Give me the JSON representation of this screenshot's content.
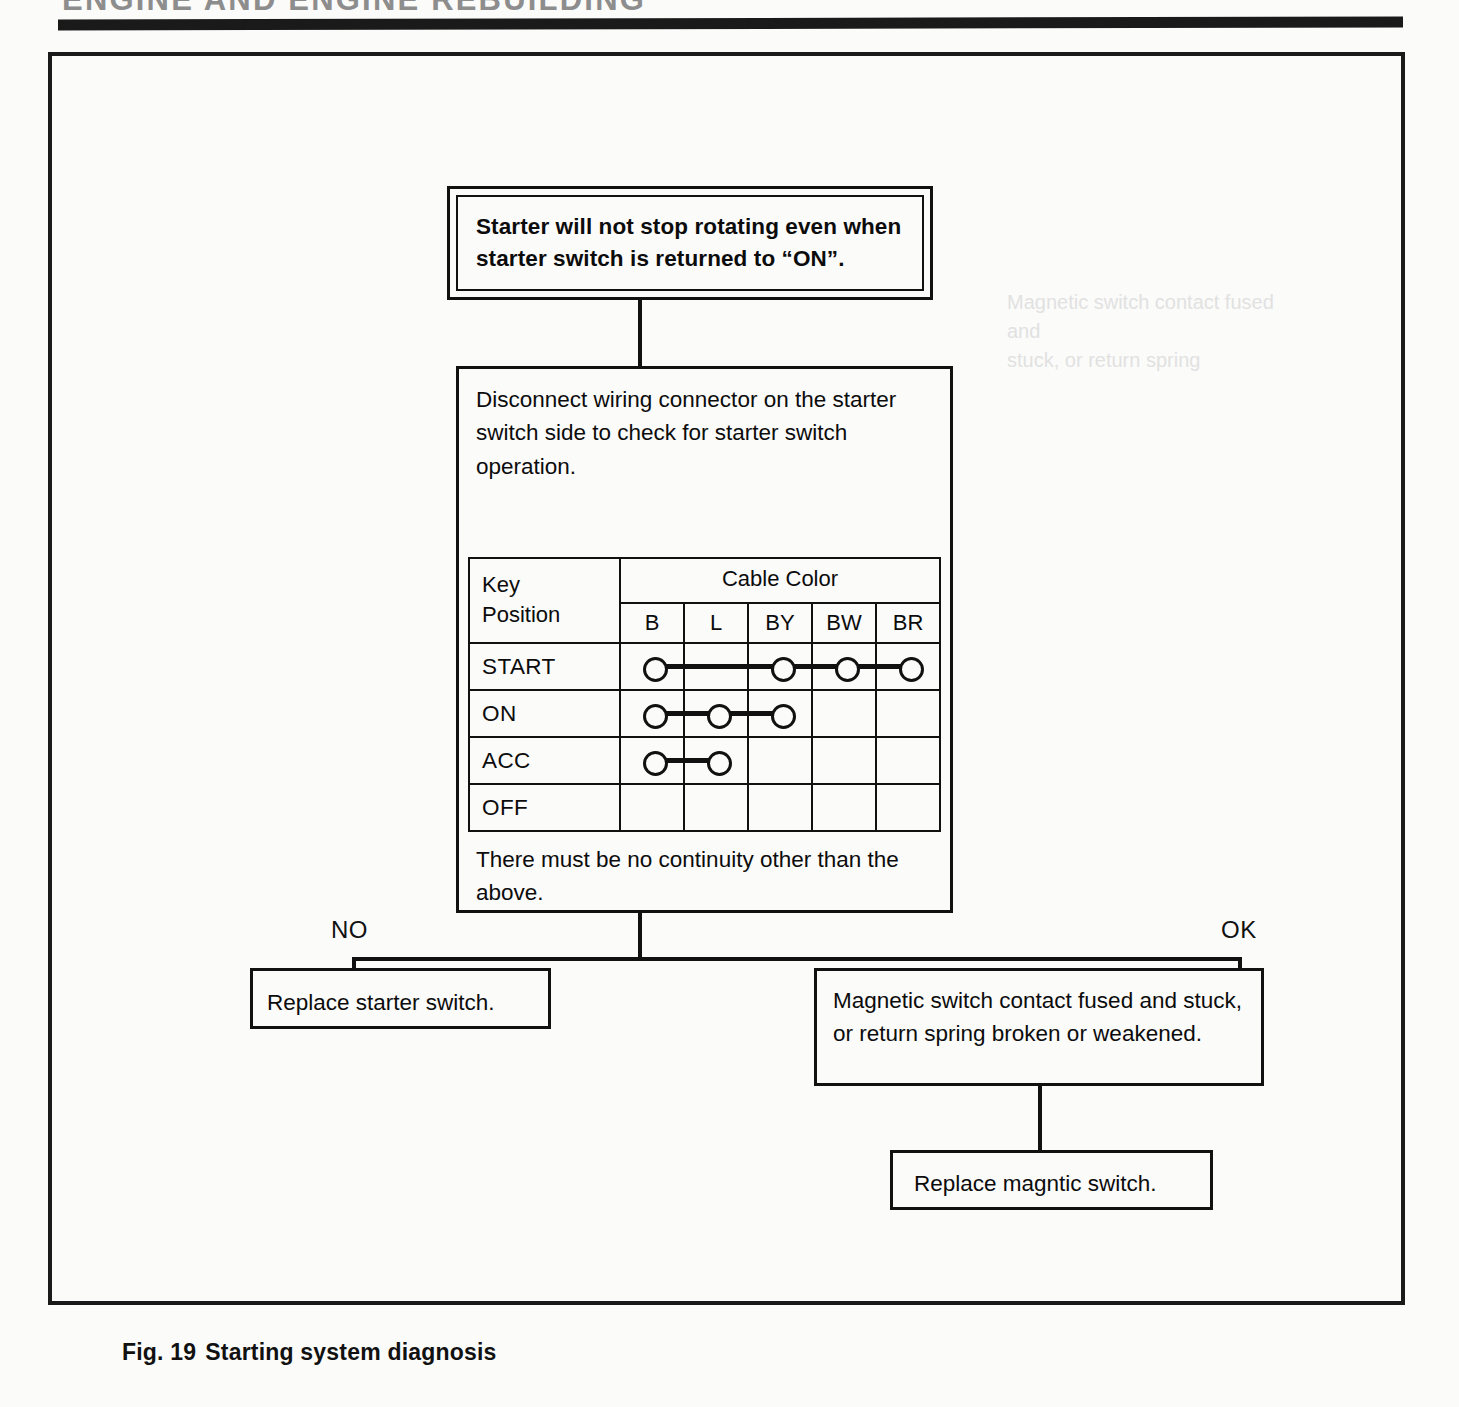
{
  "running_head": {
    "text": "ENGINE AND ENGINE REBUILDING"
  },
  "figure": {
    "caption_number": "Fig. 19",
    "caption_title": "Starting system diagnosis"
  },
  "flow": {
    "symptom_box": {
      "text": "Starter will not stop rotating even when starter switch is returned to “ON”."
    },
    "check_box": {
      "lead_text": "Disconnect wiring connector on the starter switch side to check for starter switch operation.",
      "tail_text": "There must be no continuity other than the above."
    },
    "branch_no_label": "NO",
    "branch_ok_label": "OK",
    "replace_starter_box": {
      "text": "Replace starter switch."
    },
    "magnetic_box": {
      "text": "Magnetic switch contact fused and stuck, or return spring broken or weakened."
    },
    "replace_magnetic_box": {
      "text": "Replace magntic switch."
    }
  },
  "continuity_table": {
    "row_header_line1": "Key",
    "row_header_line2": "Position",
    "group_header": "Cable Color",
    "columns": [
      "B",
      "L",
      "BY",
      "BW",
      "BR"
    ],
    "rows": [
      {
        "position": "START",
        "dots": [
          true,
          false,
          true,
          true,
          true
        ]
      },
      {
        "position": "ON",
        "dots": [
          true,
          true,
          true,
          false,
          false
        ]
      },
      {
        "position": "ACC",
        "dots": [
          true,
          true,
          false,
          false,
          false
        ]
      },
      {
        "position": "OFF",
        "dots": [
          false,
          false,
          false,
          false,
          false
        ]
      }
    ]
  },
  "ghost": {
    "line1": "Magnetic switch contact fused and",
    "line2": "stuck, or return spring"
  },
  "colors": {
    "ink": "#111111",
    "paper": "#fbfbfa"
  }
}
